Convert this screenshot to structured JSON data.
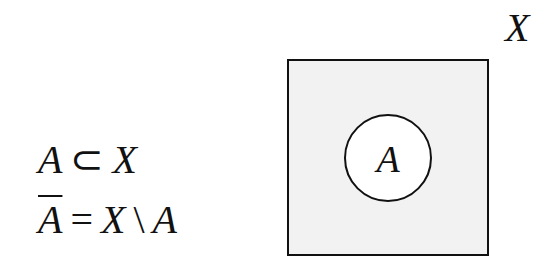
{
  "formulas": {
    "line1": {
      "lhs": "A",
      "op": "⊂",
      "rhs": "X"
    },
    "line2": {
      "lhs": "A",
      "lhs_overline": true,
      "op": "=",
      "rhs_a": "X",
      "setminus": "\\",
      "rhs_b": "A"
    }
  },
  "diagram": {
    "universe_label": "X",
    "subset_label": "A",
    "universe_fill": "#f2f2f2",
    "subset_fill": "#ffffff",
    "stroke": "#111111"
  }
}
